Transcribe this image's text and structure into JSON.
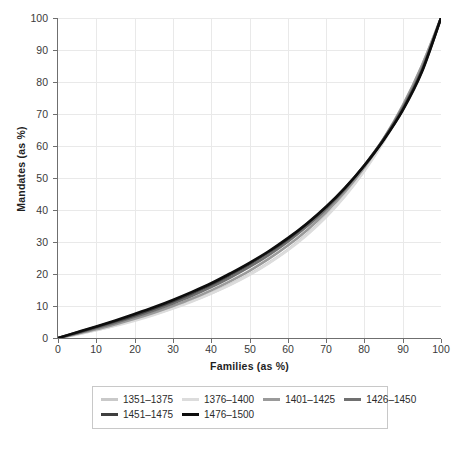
{
  "chart_data": {
    "type": "line",
    "title": "",
    "subtitle": "",
    "xlabel": "Families (as %)",
    "ylabel": "Mandates (as %)",
    "xlim": [
      0,
      100
    ],
    "ylim": [
      0,
      100
    ],
    "xticks": [
      0,
      10,
      20,
      30,
      40,
      50,
      60,
      70,
      80,
      90,
      100
    ],
    "yticks": [
      0,
      10,
      20,
      30,
      40,
      50,
      60,
      70,
      80,
      90,
      100
    ],
    "grid": true,
    "legend_position": "bottom",
    "x": [
      0,
      5,
      10,
      15,
      20,
      25,
      30,
      35,
      40,
      45,
      50,
      55,
      60,
      65,
      70,
      75,
      80,
      85,
      90,
      95,
      100
    ],
    "series": [
      {
        "name": "1351–1375",
        "color": "#c9c9c9",
        "values": [
          0,
          1.2,
          2.5,
          4.0,
          5.6,
          7.4,
          9.4,
          11.6,
          14.0,
          16.8,
          19.9,
          23.5,
          27.6,
          32.4,
          38.0,
          44.6,
          52.4,
          61.5,
          72.2,
          85.0,
          100
        ]
      },
      {
        "name": "1376–1400",
        "color": "#dcdcdc",
        "values": [
          0,
          1.1,
          2.4,
          3.8,
          5.4,
          7.2,
          9.2,
          11.4,
          13.9,
          16.6,
          19.7,
          23.3,
          27.4,
          32.2,
          37.8,
          44.4,
          52.2,
          61.3,
          72.0,
          84.8,
          100
        ]
      },
      {
        "name": "1401–1425",
        "color": "#9a9a9a",
        "values": [
          0,
          1.3,
          2.7,
          4.3,
          6.0,
          7.9,
          10.0,
          12.3,
          14.9,
          17.8,
          21.0,
          24.7,
          28.9,
          33.7,
          39.3,
          45.8,
          53.4,
          62.2,
          72.6,
          85.1,
          100
        ]
      },
      {
        "name": "1426–1450",
        "color": "#707070",
        "values": [
          0,
          1.5,
          3.1,
          4.8,
          6.6,
          8.6,
          10.8,
          13.2,
          15.9,
          18.9,
          22.2,
          25.9,
          30.1,
          34.9,
          40.3,
          46.6,
          53.9,
          62.2,
          71.9,
          84.0,
          100
        ]
      },
      {
        "name": "1451–1475",
        "color": "#3f3f3f",
        "values": [
          0,
          1.7,
          3.4,
          5.2,
          7.1,
          9.2,
          11.5,
          14.0,
          16.7,
          19.8,
          23.1,
          26.8,
          30.9,
          35.6,
          40.9,
          47.0,
          54.0,
          62.0,
          71.4,
          83.4,
          100
        ]
      },
      {
        "name": "1476–1500",
        "color": "#0d0d0d",
        "values": [
          0,
          1.8,
          3.6,
          5.5,
          7.5,
          9.6,
          11.9,
          14.4,
          17.1,
          20.2,
          23.5,
          27.1,
          31.2,
          35.8,
          41.0,
          47.0,
          53.9,
          61.8,
          71.1,
          83.1,
          100
        ]
      }
    ]
  },
  "axes": {
    "x_title": "Families (as %)",
    "y_title": "Mandates (as %)",
    "x_tick_labels": [
      "0",
      "10",
      "20",
      "30",
      "40",
      "50",
      "60",
      "70",
      "80",
      "90",
      "100"
    ],
    "y_tick_labels": [
      "0",
      "10",
      "20",
      "30",
      "40",
      "50",
      "60",
      "70",
      "80",
      "90",
      "100"
    ]
  },
  "legend": {
    "rows": [
      [
        {
          "label": "1351–1375",
          "color": "#c9c9c9"
        },
        {
          "label": "1376–1400",
          "color": "#dcdcdc"
        },
        {
          "label": "1401–1425",
          "color": "#9a9a9a"
        },
        {
          "label": "1426–1450",
          "color": "#707070"
        }
      ],
      [
        {
          "label": "1451–1475",
          "color": "#3f3f3f"
        },
        {
          "label": "1476–1500",
          "color": "#0d0d0d"
        }
      ]
    ]
  },
  "style": {
    "grid_color": "#e9e9e9",
    "axis_color": "#6f6f6f",
    "background": "#ffffff",
    "text_color": "#2b2b2b"
  }
}
